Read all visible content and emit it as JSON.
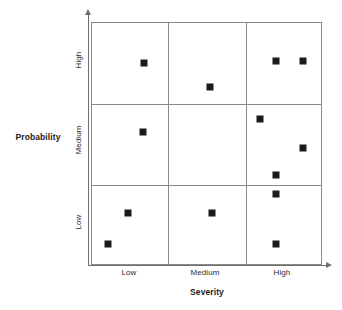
{
  "chart_data": {
    "type": "scatter",
    "title": "",
    "xlabel": "Severity",
    "ylabel": "Probability",
    "categories_x": [
      "Low",
      "Medium",
      "High"
    ],
    "categories_y": [
      "Low",
      "Medium",
      "High"
    ],
    "grid": true,
    "legend": "none",
    "xlim": [
      0,
      3
    ],
    "ylim": [
      0,
      3
    ],
    "marker_style": "filled-square",
    "marker_color": "#1b1b1b",
    "grid_color": "#8a8a8a",
    "axis_color": "#6e6e6e",
    "background_color": "#ffffff",
    "points": [
      {
        "id": "p1",
        "x": 0.67,
        "y": 2.51,
        "severity": "Low",
        "probability": "High",
        "px": 143,
        "py": 62
      },
      {
        "id": "p2",
        "x": 1.53,
        "y": 2.22,
        "severity": "Medium",
        "probability": "High",
        "px": 209,
        "py": 86
      },
      {
        "id": "p3",
        "x": 2.39,
        "y": 2.54,
        "severity": "High",
        "probability": "High",
        "px": 275,
        "py": 60
      },
      {
        "id": "p4",
        "x": 2.74,
        "y": 2.54,
        "severity": "High",
        "probability": "High",
        "px": 302,
        "py": 60
      },
      {
        "id": "p5",
        "x": 0.66,
        "y": 1.68,
        "severity": "Low",
        "probability": "Medium",
        "px": 142,
        "py": 131
      },
      {
        "id": "p6",
        "x": 2.18,
        "y": 1.84,
        "severity": "High",
        "probability": "Medium",
        "px": 259,
        "py": 118
      },
      {
        "id": "p7",
        "x": 2.74,
        "y": 1.48,
        "severity": "High",
        "probability": "Medium",
        "px": 302,
        "py": 147
      },
      {
        "id": "p8",
        "x": 2.39,
        "y": 1.14,
        "severity": "High",
        "probability": "Medium",
        "px": 275,
        "py": 174
      },
      {
        "id": "p9",
        "x": 2.39,
        "y": 0.9,
        "severity": "High",
        "probability": "Low",
        "px": 275,
        "py": 193
      },
      {
        "id": "p10",
        "x": 0.47,
        "y": 0.66,
        "severity": "Low",
        "probability": "Low",
        "px": 127,
        "py": 212
      },
      {
        "id": "p11",
        "x": 1.56,
        "y": 0.66,
        "severity": "Medium",
        "probability": "Low",
        "px": 211,
        "py": 212
      },
      {
        "id": "p12",
        "x": 0.21,
        "y": 0.28,
        "severity": "Low",
        "probability": "Low",
        "px": 107,
        "py": 243
      },
      {
        "id": "p13",
        "x": 2.39,
        "y": 0.28,
        "severity": "High",
        "probability": "Low",
        "px": 275,
        "py": 243
      }
    ]
  },
  "axes": {
    "x": {
      "title": "Severity",
      "ticks": [
        {
          "label": "Low",
          "px": 129
        },
        {
          "label": "Medium",
          "px": 205
        },
        {
          "label": "High",
          "px": 282
        }
      ]
    },
    "y": {
      "title": "Probability",
      "ticks": [
        {
          "label": "High",
          "py": 60
        },
        {
          "label": "Medium",
          "py": 140
        },
        {
          "label": "Low",
          "py": 222
        }
      ]
    }
  },
  "grid_lines": {
    "vertical_px": [
      76,
      154
    ],
    "horizontal_px": [
      81,
      162
    ]
  }
}
